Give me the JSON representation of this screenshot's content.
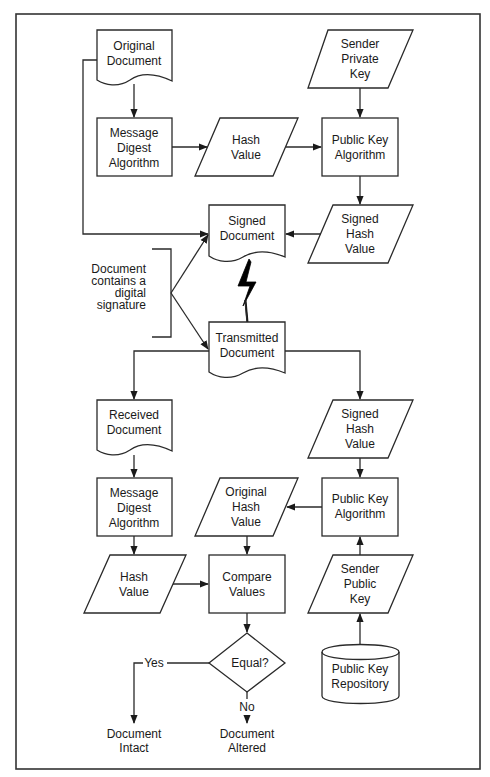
{
  "diagram": {
    "type": "flowchart",
    "colors": {
      "stroke": "#2a2a2a",
      "fill": "#ffffff",
      "text": "#1a1a1a",
      "background": "#ffffff"
    },
    "signing": {
      "original_document": [
        "Original",
        "Document"
      ],
      "sender_private_key": [
        "Sender",
        "Private",
        "Key"
      ],
      "message_digest": [
        "Message",
        "Digest",
        "Algorithm"
      ],
      "hash_value": [
        "Hash",
        "Value"
      ],
      "public_key_algorithm": [
        "Public Key",
        "Algorithm"
      ],
      "signed_hash_value": [
        "Signed",
        "Hash",
        "Value"
      ],
      "signed_document": [
        "Signed",
        "Document"
      ]
    },
    "annotation": [
      "Document",
      "contains a",
      "digital",
      "signature"
    ],
    "transmitted_document": [
      "Transmitted",
      "Document"
    ],
    "verification": {
      "received_document": [
        "Received",
        "Document"
      ],
      "signed_hash_value": [
        "Signed",
        "Hash",
        "Value"
      ],
      "message_digest": [
        "Message",
        "Digest",
        "Algorithm"
      ],
      "original_hash_value": [
        "Original",
        "Hash",
        "Value"
      ],
      "public_key_algorithm": [
        "Public Key",
        "Algorithm"
      ],
      "hash_value": [
        "Hash",
        "Value"
      ],
      "compare_values": [
        "Compare",
        "Values"
      ],
      "sender_public_key": [
        "Sender",
        "Public",
        "Key"
      ],
      "decision": [
        "Equal?"
      ],
      "yes_label": [
        "Yes"
      ],
      "no_label": [
        "No"
      ],
      "public_key_repository": [
        "Public Key",
        "Repository"
      ],
      "document_intact": [
        "Document",
        "Intact"
      ],
      "document_altered": [
        "Document",
        "Altered"
      ]
    }
  }
}
